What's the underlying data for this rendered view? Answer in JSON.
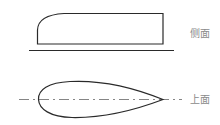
{
  "diagram": {
    "side_view": {
      "label": "侧面"
    },
    "top_view": {
      "label": "上面"
    },
    "colors": {
      "stroke": "#2a2a2a",
      "label": "#8a8a8a",
      "centerline": "#777777"
    }
  }
}
